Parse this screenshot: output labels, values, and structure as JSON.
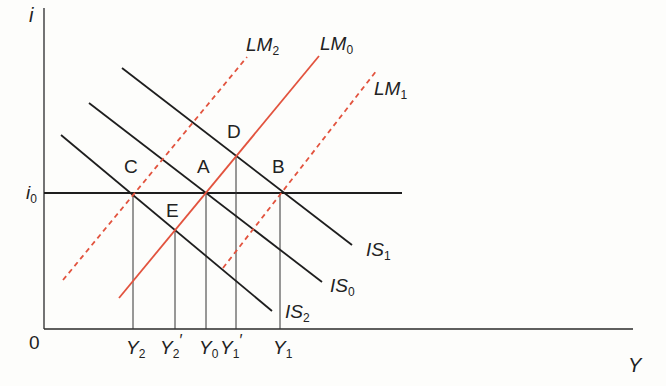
{
  "diagram": {
    "type": "IS-LM",
    "colors": {
      "axis": "#2a2a2a",
      "is_curve": "#1e1e1e",
      "lm_curve": "#e2533e",
      "guide": "#333333",
      "background": "#fdfdfb"
    },
    "axes": {
      "y_label": "i",
      "x_label": "Y",
      "origin_label": "0",
      "i0": {
        "main": "i",
        "sub": "0"
      }
    },
    "curves": {
      "LM2": {
        "main": "LM",
        "sub": "2",
        "style": "dashed"
      },
      "LM0": {
        "main": "LM",
        "sub": "0",
        "style": "solid"
      },
      "LM1": {
        "main": "LM",
        "sub": "1",
        "style": "dashed"
      },
      "IS1": {
        "main": "IS",
        "sub": "1"
      },
      "IS0": {
        "main": "IS",
        "sub": "0"
      },
      "IS2": {
        "main": "IS",
        "sub": "2"
      }
    },
    "points": {
      "A": "A",
      "B": "B",
      "C": "C",
      "D": "D",
      "E": "E"
    },
    "x_ticks": {
      "Y2": {
        "main": "Y",
        "sub": "2",
        "prime": ""
      },
      "Y2p": {
        "main": "Y",
        "sub": "2",
        "prime": "′"
      },
      "Y0": {
        "main": "Y",
        "sub": "0",
        "prime": ""
      },
      "Y1p": {
        "main": "Y",
        "sub": "1",
        "prime": "′"
      },
      "Y1": {
        "main": "Y",
        "sub": "1",
        "prime": ""
      }
    }
  }
}
